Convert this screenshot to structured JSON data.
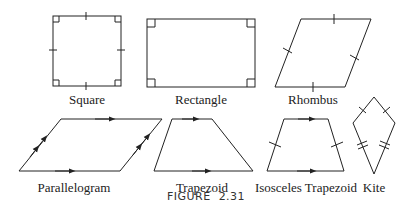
{
  "figure": {
    "caption_word": "FIGURE",
    "caption_number": "2.31"
  },
  "shapes": [
    {
      "name": "square",
      "label": "Square"
    },
    {
      "name": "rectangle",
      "label": "Rectangle"
    },
    {
      "name": "rhombus",
      "label": "Rhombus"
    },
    {
      "name": "parallelogram",
      "label": "Parallelogram"
    },
    {
      "name": "trapezoid",
      "label": "Trapezoid"
    },
    {
      "name": "isosceles-trapezoid",
      "label": "Isosceles Trapezoid"
    },
    {
      "name": "kite",
      "label": "Kite"
    }
  ],
  "colors": {
    "stroke": "#222222",
    "background": "#ffffff"
  }
}
